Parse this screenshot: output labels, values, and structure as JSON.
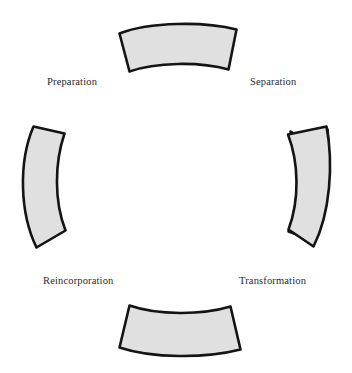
{
  "diagram": {
    "type": "cycle-diagram",
    "background_color": "#ffffff",
    "segment_fill_color": "#e0e0e0",
    "segment_stroke_color": "#1a1a1a",
    "label_color": "#2b2b2b",
    "segment_count": 4,
    "label_count": 4,
    "labels": [
      {
        "id": "preparation",
        "text": "Preparation",
        "position": "upper-left"
      },
      {
        "id": "separation",
        "text": "Separation",
        "position": "upper-right"
      },
      {
        "id": "reincorporation",
        "text": "Reincorporation",
        "position": "lower-left"
      },
      {
        "id": "transformation",
        "text": "Transformation",
        "position": "lower-right"
      }
    ],
    "segments": [
      {
        "id": "top-segment",
        "position": "top"
      },
      {
        "id": "right-segment",
        "position": "right"
      },
      {
        "id": "bottom-segment",
        "position": "bottom"
      },
      {
        "id": "left-segment",
        "position": "left"
      }
    ]
  }
}
